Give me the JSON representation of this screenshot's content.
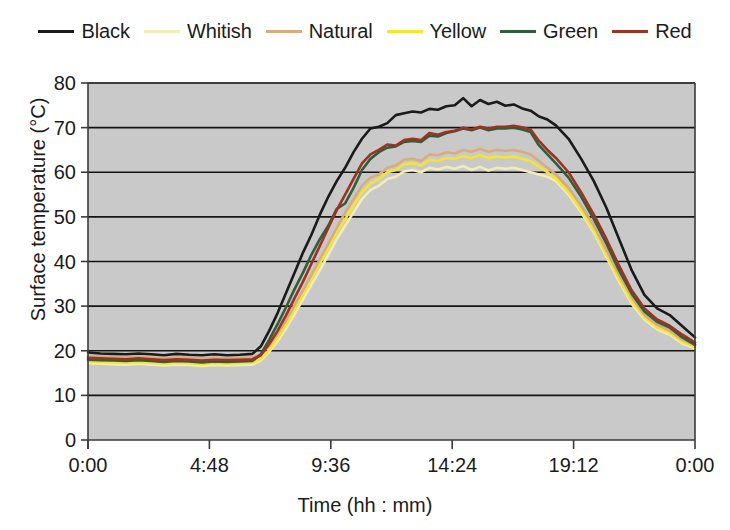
{
  "chart_data": {
    "type": "line",
    "title": "",
    "xlabel": "Time (hh : mm)",
    "ylabel": "Surface temperature (°C)",
    "xlim": [
      0,
      1440
    ],
    "ylim": [
      0,
      80
    ],
    "grid": true,
    "legend_position": "top",
    "x_tick_labels": [
      "0:00",
      "4:48",
      "9:36",
      "14:24",
      "19:12",
      "0:00"
    ],
    "x_tick_values": [
      0,
      288,
      576,
      864,
      1152,
      1440
    ],
    "y_tick_labels": [
      "0",
      "10",
      "20",
      "30",
      "40",
      "50",
      "60",
      "70",
      "80"
    ],
    "y_tick_values": [
      0,
      10,
      20,
      30,
      40,
      50,
      60,
      70,
      80
    ],
    "x": [
      0,
      30,
      60,
      90,
      120,
      150,
      180,
      210,
      240,
      270,
      300,
      330,
      360,
      390,
      410,
      430,
      450,
      470,
      490,
      510,
      530,
      550,
      570,
      590,
      610,
      630,
      650,
      670,
      690,
      710,
      730,
      750,
      770,
      790,
      810,
      830,
      850,
      870,
      890,
      910,
      930,
      950,
      970,
      990,
      1010,
      1030,
      1050,
      1070,
      1090,
      1110,
      1140,
      1170,
      1200,
      1230,
      1260,
      1290,
      1320,
      1350,
      1380,
      1410,
      1440
    ],
    "series": [
      {
        "name": "Black",
        "color": "#1a1a1a",
        "width": 2.6,
        "values": [
          19.6,
          19.4,
          19.3,
          19.2,
          19.4,
          19.2,
          19.0,
          19.3,
          19.1,
          19.0,
          19.2,
          19.0,
          19.1,
          19.3,
          21.0,
          24.5,
          28.5,
          33.0,
          37.5,
          42.0,
          46.0,
          50.5,
          54.5,
          58.0,
          61.0,
          64.5,
          67.5,
          69.8,
          70.2,
          71.0,
          72.8,
          73.2,
          73.6,
          73.4,
          74.2,
          74.0,
          74.8,
          75.0,
          76.6,
          74.8,
          76.2,
          75.3,
          75.8,
          74.9,
          75.2,
          74.3,
          73.8,
          72.5,
          71.8,
          70.5,
          67.5,
          63.0,
          58.0,
          52.0,
          45.0,
          38.0,
          32.5,
          29.5,
          28.0,
          25.5,
          23.0
        ]
      },
      {
        "name": "Red",
        "color": "#9b3324",
        "width": 2.6,
        "values": [
          18.4,
          18.3,
          18.2,
          18.1,
          18.3,
          18.1,
          17.9,
          18.1,
          18.0,
          17.8,
          18.0,
          17.9,
          18.0,
          18.1,
          19.0,
          21.5,
          24.5,
          28.0,
          31.8,
          35.5,
          39.5,
          43.5,
          47.5,
          51.5,
          55.0,
          58.5,
          62.0,
          64.0,
          65.0,
          66.2,
          66.0,
          67.2,
          67.5,
          67.2,
          68.8,
          68.4,
          69.0,
          69.3,
          70.0,
          69.6,
          70.2,
          69.8,
          70.2,
          70.2,
          70.4,
          70.1,
          69.6,
          67.0,
          65.0,
          63.2,
          60.0,
          55.5,
          50.5,
          45.0,
          39.0,
          33.5,
          29.5,
          27.0,
          25.6,
          23.6,
          21.8
        ]
      },
      {
        "name": "Green",
        "color": "#2f5e38",
        "width": 2.6,
        "values": [
          18.0,
          17.9,
          17.8,
          17.7,
          17.9,
          17.7,
          17.5,
          17.7,
          17.6,
          17.4,
          17.6,
          17.5,
          17.6,
          17.7,
          19.2,
          22.5,
          26.0,
          29.8,
          33.8,
          37.5,
          41.5,
          45.0,
          48.0,
          51.8,
          53.0,
          56.5,
          60.5,
          63.0,
          64.5,
          65.5,
          65.8,
          66.8,
          67.0,
          66.8,
          68.2,
          68.0,
          68.8,
          69.2,
          69.8,
          69.4,
          70.0,
          69.4,
          69.8,
          69.8,
          70.0,
          69.6,
          69.0,
          66.0,
          64.0,
          62.0,
          58.8,
          54.5,
          49.5,
          44.0,
          38.0,
          32.8,
          28.8,
          26.5,
          25.2,
          23.0,
          21.3
        ]
      },
      {
        "name": "Natural",
        "color": "#d8ad7d",
        "width": 2.6,
        "values": [
          18.8,
          18.7,
          18.6,
          18.5,
          18.7,
          18.5,
          18.3,
          18.5,
          18.4,
          18.2,
          18.4,
          18.3,
          18.4,
          18.5,
          19.2,
          21.2,
          23.8,
          26.8,
          30.2,
          33.5,
          37.0,
          40.5,
          44.0,
          47.5,
          51.0,
          54.0,
          57.0,
          58.8,
          59.5,
          61.0,
          61.5,
          62.8,
          63.0,
          62.5,
          64.0,
          63.8,
          64.5,
          64.2,
          65.0,
          64.6,
          65.2,
          64.6,
          65.0,
          64.8,
          65.0,
          64.6,
          64.0,
          62.5,
          61.0,
          59.5,
          56.5,
          52.5,
          48.0,
          42.5,
          37.0,
          32.0,
          28.0,
          25.8,
          24.5,
          22.5,
          21.3
        ]
      },
      {
        "name": "Yellow",
        "color": "#f2e534",
        "width": 2.6,
        "values": [
          17.6,
          17.5,
          17.4,
          17.3,
          17.5,
          17.3,
          17.1,
          17.3,
          17.2,
          17.0,
          17.2,
          17.1,
          17.2,
          17.3,
          18.2,
          20.2,
          22.8,
          25.8,
          29.2,
          32.5,
          36.0,
          39.5,
          43.0,
          46.5,
          49.5,
          52.5,
          55.5,
          57.5,
          58.5,
          60.0,
          60.5,
          61.8,
          62.0,
          61.5,
          62.8,
          62.5,
          63.2,
          63.0,
          63.6,
          63.2,
          63.8,
          63.2,
          63.5,
          63.3,
          63.5,
          63.0,
          62.5,
          61.2,
          60.0,
          58.5,
          55.5,
          51.5,
          47.0,
          41.5,
          36.0,
          31.0,
          27.5,
          25.2,
          24.0,
          22.0,
          20.8
        ]
      },
      {
        "name": "Whitish",
        "color": "#f2ecb8",
        "width": 2.6,
        "values": [
          17.2,
          17.1,
          17.0,
          16.9,
          17.1,
          16.9,
          16.7,
          16.9,
          16.8,
          16.6,
          16.8,
          16.7,
          16.8,
          16.9,
          17.8,
          19.8,
          22.2,
          25.0,
          28.2,
          31.5,
          34.8,
          38.0,
          41.5,
          45.0,
          48.0,
          51.0,
          54.0,
          56.0,
          57.0,
          58.5,
          59.0,
          60.2,
          60.5,
          60.0,
          61.0,
          60.6,
          61.2,
          60.8,
          61.4,
          60.5,
          61.2,
          60.4,
          61.0,
          60.8,
          61.0,
          60.5,
          60.0,
          59.5,
          59.0,
          58.0,
          55.0,
          51.0,
          46.5,
          41.0,
          35.5,
          30.5,
          27.0,
          24.8,
          23.6,
          21.6,
          20.5
        ]
      }
    ]
  },
  "legend": {
    "items": [
      {
        "label": "Black",
        "color": "#1a1a1a"
      },
      {
        "label": "Whitish",
        "color": "#f2ecb8"
      },
      {
        "label": "Natural",
        "color": "#d8ad7d"
      },
      {
        "label": "Yellow",
        "color": "#f2e534"
      },
      {
        "label": "Green",
        "color": "#2f5e38"
      },
      {
        "label": "Red",
        "color": "#9b3324"
      }
    ]
  },
  "plot_style": {
    "background": "#c9c9c9",
    "gridline_color": "#141414",
    "axis_color": "#3a3a3a"
  }
}
